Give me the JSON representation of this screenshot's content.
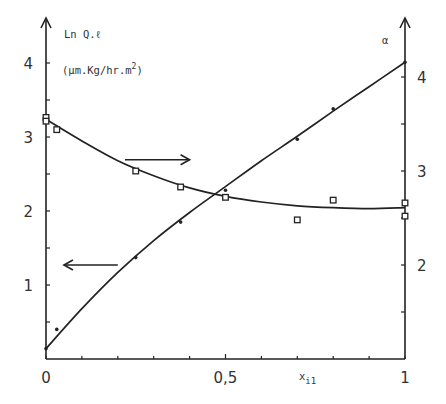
{
  "chart_data": {
    "type": "line",
    "title": "",
    "xlabel": "x_i1",
    "xlabel_main": "x",
    "xlabel_sub": "i1",
    "ylabel_left": "Ln Q.ℓ",
    "ylabel_left_units": "(μm.Kg/hr.m²)",
    "ylabel_left_units_base": "(μm.Kg/hr.m",
    "ylabel_left_units_sup": "2",
    "ylabel_left_units_close": ")",
    "ylabel_right": "α",
    "xlim": [
      0,
      1
    ],
    "ylim_left": [
      0,
      4.4
    ],
    "ylim_right": [
      1,
      4.3
    ],
    "x_ticks": [
      0,
      0.1,
      0.2,
      0.3,
      0.4,
      0.5,
      0.6,
      0.7,
      0.8,
      0.9,
      1.0
    ],
    "x_tick_labels": [
      {
        "value": 0,
        "label": "0"
      },
      {
        "value": 0.5,
        "label": "0,5"
      },
      {
        "value": 1,
        "label": "1"
      }
    ],
    "y_left_ticks": [
      0.5,
      1,
      1.5,
      2,
      2.5,
      3,
      3.5,
      4
    ],
    "y_left_tick_labels": [
      {
        "value": 1,
        "label": "1"
      },
      {
        "value": 2,
        "label": "2"
      },
      {
        "value": 3,
        "label": "3"
      },
      {
        "value": 4,
        "label": "4"
      }
    ],
    "y_right_ticks": [
      1.5,
      2,
      2.5,
      3,
      3.5,
      4
    ],
    "y_right_tick_labels": [
      {
        "value": 2,
        "label": "2"
      },
      {
        "value": 3,
        "label": "3"
      },
      {
        "value": 4,
        "label": "4"
      }
    ],
    "grid": false,
    "legend": "none (arrows indicate axis)",
    "series": [
      {
        "name": "Ln Q.ℓ",
        "axis": "left",
        "marker": "dot",
        "points": [
          {
            "x": 0.0,
            "y": 0.14
          },
          {
            "x": 0.03,
            "y": 0.4
          },
          {
            "x": 0.25,
            "y": 1.37
          },
          {
            "x": 0.375,
            "y": 1.85
          },
          {
            "x": 0.5,
            "y": 2.28
          },
          {
            "x": 0.7,
            "y": 2.97
          },
          {
            "x": 0.8,
            "y": 3.38
          },
          {
            "x": 1.0,
            "y": 4.01
          }
        ],
        "fit_curve": [
          {
            "x": 0.0,
            "y": 0.14
          },
          {
            "x": 0.1,
            "y": 0.68
          },
          {
            "x": 0.2,
            "y": 1.17
          },
          {
            "x": 0.3,
            "y": 1.6
          },
          {
            "x": 0.4,
            "y": 1.98
          },
          {
            "x": 0.5,
            "y": 2.33
          },
          {
            "x": 0.6,
            "y": 2.68
          },
          {
            "x": 0.7,
            "y": 3.01
          },
          {
            "x": 0.8,
            "y": 3.35
          },
          {
            "x": 0.9,
            "y": 3.68
          },
          {
            "x": 1.0,
            "y": 4.01
          }
        ]
      },
      {
        "name": "α",
        "axis": "right",
        "marker": "square",
        "points": [
          {
            "x": 0.0,
            "y": 3.57
          },
          {
            "x": 0.0,
            "y": 3.53
          },
          {
            "x": 0.03,
            "y": 3.44
          },
          {
            "x": 0.25,
            "y": 3.0
          },
          {
            "x": 0.375,
            "y": 2.83
          },
          {
            "x": 0.5,
            "y": 2.72
          },
          {
            "x": 0.7,
            "y": 2.48
          },
          {
            "x": 0.8,
            "y": 2.69
          },
          {
            "x": 1.0,
            "y": 2.66
          },
          {
            "x": 1.0,
            "y": 2.52
          }
        ],
        "fit_curve": [
          {
            "x": 0.0,
            "y": 3.55
          },
          {
            "x": 0.1,
            "y": 3.32
          },
          {
            "x": 0.2,
            "y": 3.11
          },
          {
            "x": 0.3,
            "y": 2.95
          },
          {
            "x": 0.4,
            "y": 2.82
          },
          {
            "x": 0.5,
            "y": 2.73
          },
          {
            "x": 0.6,
            "y": 2.67
          },
          {
            "x": 0.7,
            "y": 2.63
          },
          {
            "x": 0.8,
            "y": 2.61
          },
          {
            "x": 0.9,
            "y": 2.6
          },
          {
            "x": 1.0,
            "y": 2.61
          }
        ]
      }
    ],
    "annotations": [
      {
        "type": "arrow",
        "direction": "right",
        "meaning": "α curve reads right axis",
        "from": [
          0.22,
          3.12
        ],
        "to": [
          0.4,
          3.12
        ],
        "axis": "right"
      },
      {
        "type": "arrow",
        "direction": "left",
        "meaning": "Ln Q.ℓ line reads left axis",
        "from": [
          0.2,
          1.27
        ],
        "to": [
          0.05,
          1.27
        ],
        "axis": "left"
      }
    ]
  }
}
